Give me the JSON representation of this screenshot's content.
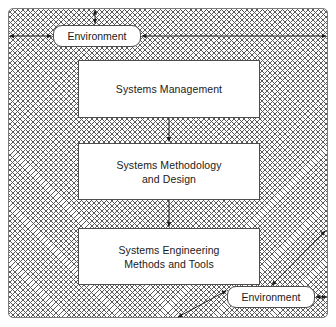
{
  "diagram": {
    "frame": {
      "name": "environment-boundary",
      "fill_pattern": "cross-hatch",
      "border_color": "#4d4d4d"
    },
    "environment_labels": [
      {
        "id": "env-top",
        "label": "Environment"
      },
      {
        "id": "env-bottom",
        "label": "Environment"
      }
    ],
    "boxes": [
      {
        "id": "box-mgmt",
        "line1": "Systems Management",
        "line2": ""
      },
      {
        "id": "box-meth",
        "line1": "Systems Methodology",
        "line2": "and  Design"
      },
      {
        "id": "box-eng",
        "line1": "Systems Engineering",
        "line2": "Methods and Tools"
      }
    ],
    "connectors": [
      {
        "id": "arrow-mgmt-to-meth",
        "from": "box-mgmt",
        "to": "box-meth",
        "style": "single-head-down"
      },
      {
        "id": "arrow-meth-to-eng",
        "from": "box-meth",
        "to": "box-eng",
        "style": "single-head-down"
      },
      {
        "id": "arrow-env-top-up",
        "from": "env-top",
        "to": "frame-top",
        "style": "double-head-vertical"
      },
      {
        "id": "arrow-env-top-left",
        "from": "frame-left",
        "to": "env-top",
        "style": "double-head-horizontal"
      },
      {
        "id": "arrow-env-top-right",
        "from": "env-top",
        "to": "frame-right",
        "style": "double-head-horizontal"
      },
      {
        "id": "arrow-env-bottom-diag-up",
        "from": "env-bottom",
        "to": "frame-corner-upper-right",
        "style": "double-head-diagonal"
      },
      {
        "id": "arrow-env-bottom-diag-down",
        "from": "env-bottom",
        "to": "frame-bottom",
        "style": "double-head-diagonal"
      },
      {
        "id": "arrow-env-bottom-right",
        "from": "env-bottom",
        "to": "frame-right",
        "style": "double-head-horizontal"
      }
    ],
    "colors": {
      "hatch": "#5a5a5a",
      "box_border": "#4d4d4d",
      "box_fill": "#ffffff",
      "text": "#1a1a1a",
      "page_background": "#ffffff"
    }
  }
}
